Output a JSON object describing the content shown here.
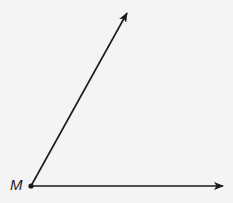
{
  "diagram": {
    "type": "angle",
    "vertex": {
      "label": "M",
      "x": 31,
      "y": 186
    },
    "rays": [
      {
        "name": "upper-ray",
        "to": {
          "x": 127,
          "y": 12
        }
      },
      {
        "name": "horizontal-ray",
        "to": {
          "x": 223,
          "y": 186
        }
      }
    ],
    "colors": {
      "stroke": "#1a1a1a",
      "background": "#f4f4f4"
    }
  }
}
